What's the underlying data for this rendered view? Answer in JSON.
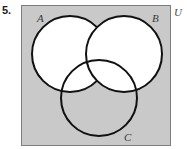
{
  "problem": {
    "number": "5."
  },
  "diagram": {
    "type": "venn-three-set",
    "universe_label": "U",
    "sets": [
      {
        "id": "A",
        "label": "A",
        "cx": 49,
        "cy": 49,
        "r": 38,
        "fill": "#ffffff",
        "stroke": "#111111"
      },
      {
        "id": "B",
        "label": "B",
        "cx": 103,
        "cy": 49,
        "r": 38,
        "fill": "#ffffff",
        "stroke": "#111111"
      },
      {
        "id": "C",
        "label": "C",
        "cx": 78,
        "cy": 93,
        "r": 38,
        "fill": "none",
        "stroke": "#111111"
      }
    ],
    "background_color": "#c9c9c9",
    "border_color": "#7d7d7d",
    "stroke_width": 2,
    "shaded_regions": "none"
  }
}
